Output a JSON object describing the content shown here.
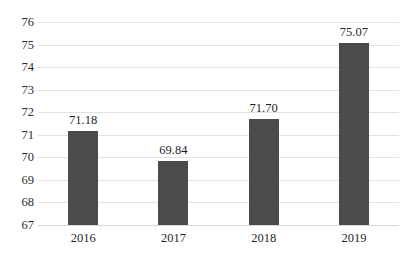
{
  "chart_data": {
    "type": "bar",
    "title": "",
    "subtitle": "",
    "xlabel": "",
    "ylabel": "",
    "categories": [
      "2016",
      "2017",
      "2018",
      "2019"
    ],
    "values": [
      71.18,
      69.84,
      71.7,
      75.07
    ],
    "value_labels": [
      "71.18",
      "69.84",
      "71.70",
      "75.07"
    ],
    "ylim": [
      67,
      76
    ],
    "ytick_labels": [
      "67",
      "68",
      "69",
      "70",
      "71",
      "72",
      "73",
      "74",
      "75",
      "76"
    ],
    "ytick_values": [
      67,
      68,
      69,
      70,
      71,
      72,
      73,
      74,
      75,
      76
    ],
    "grid": true,
    "grid_axis": "y",
    "legend": false,
    "legend_position": "none",
    "series": [
      {
        "name": "",
        "values": [
          71.18,
          69.84,
          71.7,
          75.07
        ]
      }
    ],
    "colors": {
      "bar": "#4b4b4b",
      "gridline": "#e2e2e2",
      "baseline": "#d8d8d8",
      "text": "#1f1f1f",
      "background": "#ffffff"
    }
  }
}
